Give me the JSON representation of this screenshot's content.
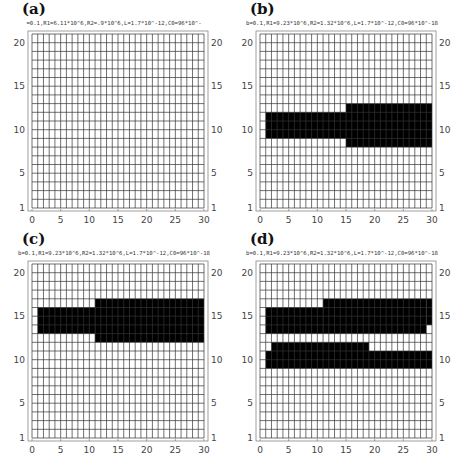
{
  "figure": {
    "grid": {
      "x_min": 0,
      "x_max": 30,
      "y_min": 1,
      "y_max": 21,
      "x_ticks": [
        0,
        5,
        10,
        15,
        20,
        25,
        30
      ],
      "y_ticks": [
        1,
        5,
        10,
        15,
        20
      ],
      "line_color": "#333333",
      "fill_color": "#000000",
      "frame_color": "#888888"
    }
  },
  "panels": [
    {
      "label": "(a)",
      "params": "=0.1,R1=6.11*10^6,R2=.9*10^6,L=1.7*10^-12,C0=96*10^-",
      "filled": []
    },
    {
      "label": "(b)",
      "params": "b=0.1,R1=9.23*10^6,R2=1.32*10^6,L=1.7*10^-12,C0=96*10^-18",
      "filled": [
        {
          "x0": 1,
          "x1": 15,
          "y0": 9,
          "y1": 12
        },
        {
          "x0": 15,
          "x1": 30,
          "y0": 8,
          "y1": 13
        }
      ]
    },
    {
      "label": "(c)",
      "params": "b=0.1,R1=9.23*10^6,R2=1.32*10^6,L=1.7*10^-12,C0=96*10^-18",
      "filled": [
        {
          "x0": 1,
          "x1": 11,
          "y0": 13,
          "y1": 16
        },
        {
          "x0": 11,
          "x1": 30,
          "y0": 12,
          "y1": 17
        }
      ]
    },
    {
      "label": "(d)",
      "params": "b=0.1,R1=9.23*10^6,R2=1.32*10^6,L=1.7*10^-12,C0=96*10^-18",
      "filled": [
        {
          "x0": 1,
          "x1": 11,
          "y0": 13,
          "y1": 16
        },
        {
          "x0": 11,
          "x1": 29,
          "y0": 13,
          "y1": 17
        },
        {
          "x0": 29,
          "x1": 30,
          "y0": 14,
          "y1": 17
        },
        {
          "x0": 2,
          "x1": 19,
          "y0": 11,
          "y1": 12
        },
        {
          "x0": 1,
          "x1": 30,
          "y0": 9,
          "y1": 11
        }
      ]
    }
  ],
  "chart_data": [
    {
      "type": "heatmap",
      "title": "(a)",
      "subtitle": "=0.1,R1=6.11*10^6,R2=.9*10^6,L=1.7*10^-12,C0=96*10^-",
      "xlabel": "",
      "ylabel": "",
      "xlim": [
        0,
        30
      ],
      "ylim": [
        1,
        21
      ],
      "grid": true,
      "x_ticks": [
        0,
        5,
        10,
        15,
        20,
        25,
        30
      ],
      "y_ticks": [
        1,
        5,
        10,
        15,
        20
      ],
      "active_regions": []
    },
    {
      "type": "heatmap",
      "title": "(b)",
      "subtitle": "b=0.1,R1=9.23*10^6,R2=1.32*10^6,L=1.7*10^-12,C0=96*10^-18",
      "xlim": [
        0,
        30
      ],
      "ylim": [
        1,
        21
      ],
      "grid": true,
      "x_ticks": [
        0,
        5,
        10,
        15,
        20,
        25,
        30
      ],
      "y_ticks": [
        1,
        5,
        10,
        15,
        20
      ],
      "active_regions": [
        {
          "x": [
            1,
            15
          ],
          "y": [
            9,
            12
          ]
        },
        {
          "x": [
            15,
            30
          ],
          "y": [
            8,
            13
          ]
        }
      ]
    },
    {
      "type": "heatmap",
      "title": "(c)",
      "subtitle": "b=0.1,R1=9.23*10^6,R2=1.32*10^6,L=1.7*10^-12,C0=96*10^-18",
      "xlim": [
        0,
        30
      ],
      "ylim": [
        1,
        21
      ],
      "grid": true,
      "x_ticks": [
        0,
        5,
        10,
        15,
        20,
        25,
        30
      ],
      "y_ticks": [
        1,
        5,
        10,
        15,
        20
      ],
      "active_regions": [
        {
          "x": [
            1,
            11
          ],
          "y": [
            13,
            16
          ]
        },
        {
          "x": [
            11,
            30
          ],
          "y": [
            12,
            17
          ]
        }
      ]
    },
    {
      "type": "heatmap",
      "title": "(d)",
      "subtitle": "b=0.1,R1=9.23*10^6,R2=1.32*10^6,L=1.7*10^-12,C0=96*10^-18",
      "xlim": [
        0,
        30
      ],
      "ylim": [
        1,
        21
      ],
      "grid": true,
      "x_ticks": [
        0,
        5,
        10,
        15,
        20,
        25,
        30
      ],
      "y_ticks": [
        1,
        5,
        10,
        15,
        20
      ],
      "active_regions": [
        {
          "x": [
            1,
            11
          ],
          "y": [
            13,
            16
          ]
        },
        {
          "x": [
            11,
            29
          ],
          "y": [
            13,
            17
          ]
        },
        {
          "x": [
            29,
            30
          ],
          "y": [
            14,
            17
          ]
        },
        {
          "x": [
            2,
            19
          ],
          "y": [
            11,
            12
          ]
        },
        {
          "x": [
            1,
            30
          ],
          "y": [
            9,
            11
          ]
        }
      ]
    }
  ]
}
